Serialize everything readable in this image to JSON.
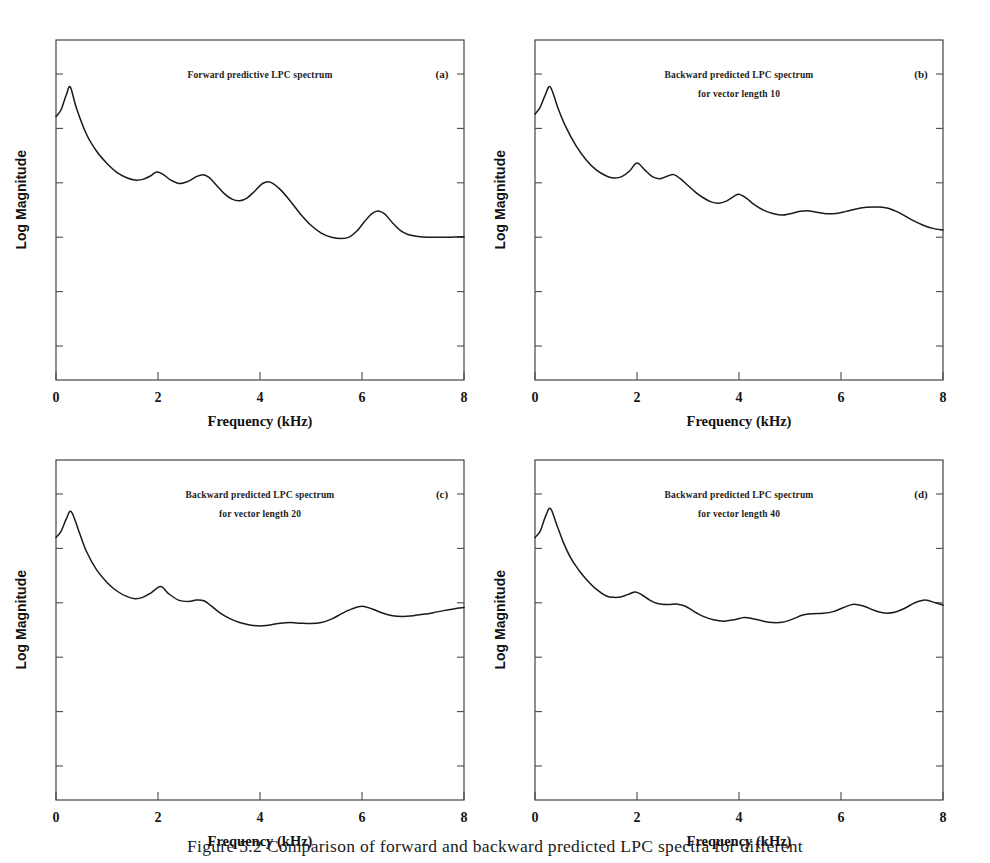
{
  "figure": {
    "caption": "Figure 5.2 Comparison of forward and backward predicted LPC spectra for different"
  },
  "axes": {
    "xlabel": "Frequency (kHz)",
    "ylabel": "Log Magnitude",
    "xticks": [
      "0",
      "2",
      "4",
      "6",
      "8"
    ]
  },
  "chart_data": [
    {
      "type": "line",
      "panel": "a",
      "tag": "(a)",
      "title_lines": [
        "Forward predictive  LPC spectrum"
      ],
      "xlabel": "Frequency (kHz)",
      "ylabel": "Log Magnitude",
      "xlim": [
        0,
        8
      ],
      "ylim": [
        0,
        1
      ],
      "xticks": [
        0,
        2,
        4,
        6,
        8
      ],
      "grid": false,
      "legend": "none",
      "x": [
        0.0,
        0.1,
        0.2,
        0.28,
        0.4,
        0.6,
        0.8,
        1.0,
        1.2,
        1.4,
        1.55,
        1.7,
        1.85,
        1.97,
        2.1,
        2.25,
        2.42,
        2.6,
        2.75,
        2.88,
        3.0,
        3.15,
        3.3,
        3.45,
        3.6,
        3.75,
        3.9,
        4.05,
        4.2,
        4.4,
        4.6,
        4.8,
        5.0,
        5.2,
        5.4,
        5.6,
        5.75,
        5.9,
        6.05,
        6.2,
        6.32,
        6.45,
        6.6,
        6.75,
        6.9,
        7.1,
        7.3,
        7.5,
        7.7,
        8.0
      ],
      "y": [
        0.775,
        0.795,
        0.838,
        0.862,
        0.8,
        0.722,
        0.672,
        0.637,
        0.61,
        0.594,
        0.588,
        0.59,
        0.6,
        0.612,
        0.605,
        0.588,
        0.578,
        0.585,
        0.598,
        0.604,
        0.596,
        0.572,
        0.548,
        0.532,
        0.527,
        0.536,
        0.556,
        0.578,
        0.582,
        0.56,
        0.525,
        0.487,
        0.455,
        0.432,
        0.42,
        0.416,
        0.42,
        0.438,
        0.466,
        0.49,
        0.497,
        0.488,
        0.462,
        0.44,
        0.428,
        0.422,
        0.42,
        0.42,
        0.42,
        0.421
      ]
    },
    {
      "type": "line",
      "panel": "b",
      "tag": "(b)",
      "title_lines": [
        "Backward predicted LPC spectrum",
        "for vector length 10"
      ],
      "xlabel": "Frequency (kHz)",
      "ylabel": "Log Magnitude",
      "xlim": [
        0,
        8
      ],
      "ylim": [
        0,
        1
      ],
      "xticks": [
        0,
        2,
        4,
        6,
        8
      ],
      "grid": false,
      "legend": "none",
      "x": [
        0.0,
        0.1,
        0.2,
        0.3,
        0.45,
        0.6,
        0.8,
        1.0,
        1.2,
        1.4,
        1.55,
        1.7,
        1.85,
        2.0,
        2.15,
        2.3,
        2.45,
        2.6,
        2.72,
        2.85,
        3.0,
        3.15,
        3.3,
        3.45,
        3.6,
        3.75,
        3.9,
        4.0,
        4.15,
        4.3,
        4.5,
        4.7,
        4.85,
        5.0,
        5.2,
        5.35,
        5.5,
        5.7,
        5.9,
        6.1,
        6.3,
        6.5,
        6.7,
        6.9,
        7.05,
        7.2,
        7.4,
        7.6,
        7.8,
        8.0
      ],
      "y": [
        0.782,
        0.802,
        0.838,
        0.862,
        0.8,
        0.746,
        0.69,
        0.648,
        0.618,
        0.6,
        0.594,
        0.598,
        0.614,
        0.638,
        0.618,
        0.598,
        0.592,
        0.6,
        0.604,
        0.592,
        0.572,
        0.552,
        0.536,
        0.524,
        0.52,
        0.526,
        0.54,
        0.546,
        0.534,
        0.516,
        0.498,
        0.488,
        0.485,
        0.489,
        0.496,
        0.498,
        0.494,
        0.489,
        0.49,
        0.496,
        0.503,
        0.508,
        0.509,
        0.506,
        0.498,
        0.487,
        0.47,
        0.456,
        0.446,
        0.441
      ]
    },
    {
      "type": "line",
      "panel": "c",
      "tag": "(c)",
      "title_lines": [
        "Backward predicted LPC spectrum",
        "for vector length 20"
      ],
      "xlabel": "Frequency (kHz)",
      "ylabel": "Log Magnitude",
      "xlim": [
        0,
        8
      ],
      "ylim": [
        0,
        1
      ],
      "xticks": [
        0,
        2,
        4,
        6,
        8
      ],
      "grid": false,
      "legend": "none",
      "x": [
        0.0,
        0.1,
        0.2,
        0.3,
        0.45,
        0.6,
        0.8,
        1.0,
        1.2,
        1.4,
        1.55,
        1.7,
        1.85,
        2.05,
        2.2,
        2.4,
        2.6,
        2.75,
        2.9,
        3.05,
        3.2,
        3.4,
        3.6,
        3.8,
        4.0,
        4.2,
        4.4,
        4.6,
        4.8,
        5.0,
        5.2,
        5.4,
        5.6,
        5.8,
        6.0,
        6.2,
        6.4,
        6.6,
        6.8,
        7.0,
        7.2,
        7.4,
        7.6,
        7.8,
        8.0
      ],
      "y": [
        0.772,
        0.79,
        0.826,
        0.848,
        0.79,
        0.73,
        0.676,
        0.64,
        0.614,
        0.598,
        0.592,
        0.596,
        0.608,
        0.628,
        0.608,
        0.588,
        0.584,
        0.588,
        0.586,
        0.57,
        0.552,
        0.534,
        0.522,
        0.515,
        0.512,
        0.515,
        0.52,
        0.522,
        0.52,
        0.519,
        0.522,
        0.532,
        0.548,
        0.562,
        0.57,
        0.562,
        0.55,
        0.542,
        0.54,
        0.542,
        0.546,
        0.551,
        0.557,
        0.562,
        0.566
      ]
    },
    {
      "type": "line",
      "panel": "d",
      "tag": "(d)",
      "title_lines": [
        "Backward predicted LPC spectrum",
        "for vector length 40"
      ],
      "xlabel": "Frequency (kHz)",
      "ylabel": "Log Magnitude",
      "xlim": [
        0,
        8
      ],
      "ylim": [
        0,
        1
      ],
      "xticks": [
        0,
        2,
        4,
        6,
        8
      ],
      "grid": false,
      "legend": "none",
      "x": [
        0.0,
        0.1,
        0.2,
        0.3,
        0.42,
        0.55,
        0.7,
        0.85,
        1.0,
        1.2,
        1.4,
        1.55,
        1.7,
        1.85,
        1.97,
        2.1,
        2.25,
        2.4,
        2.6,
        2.8,
        2.95,
        3.1,
        3.3,
        3.5,
        3.7,
        3.9,
        4.1,
        4.25,
        4.45,
        4.65,
        4.85,
        5.05,
        5.25,
        5.45,
        5.65,
        5.85,
        6.05,
        6.25,
        6.45,
        6.65,
        6.85,
        7.05,
        7.25,
        7.45,
        7.65,
        7.85,
        8.0
      ],
      "y": [
        0.772,
        0.79,
        0.832,
        0.858,
        0.812,
        0.76,
        0.712,
        0.678,
        0.65,
        0.62,
        0.6,
        0.596,
        0.598,
        0.606,
        0.612,
        0.603,
        0.588,
        0.578,
        0.575,
        0.576,
        0.57,
        0.556,
        0.54,
        0.53,
        0.526,
        0.53,
        0.537,
        0.534,
        0.527,
        0.522,
        0.523,
        0.532,
        0.544,
        0.548,
        0.549,
        0.554,
        0.566,
        0.576,
        0.57,
        0.558,
        0.55,
        0.552,
        0.564,
        0.58,
        0.588,
        0.58,
        0.573
      ]
    }
  ]
}
